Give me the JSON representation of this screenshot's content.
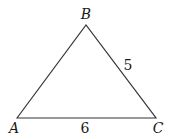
{
  "diagram": {
    "type": "triangle",
    "stroke_color": "#333333",
    "vertices": [
      {
        "name": "A",
        "x": 17,
        "y": 118,
        "label_x": 14,
        "label_y": 133
      },
      {
        "name": "B",
        "x": 86,
        "y": 25,
        "label_x": 86,
        "label_y": 19
      },
      {
        "name": "C",
        "x": 156,
        "y": 118,
        "label_x": 158,
        "label_y": 133
      }
    ],
    "side_labels": [
      {
        "side": "BC",
        "text": "5",
        "x": 128,
        "y": 70
      },
      {
        "side": "AC",
        "text": "6",
        "x": 85,
        "y": 133
      }
    ]
  }
}
